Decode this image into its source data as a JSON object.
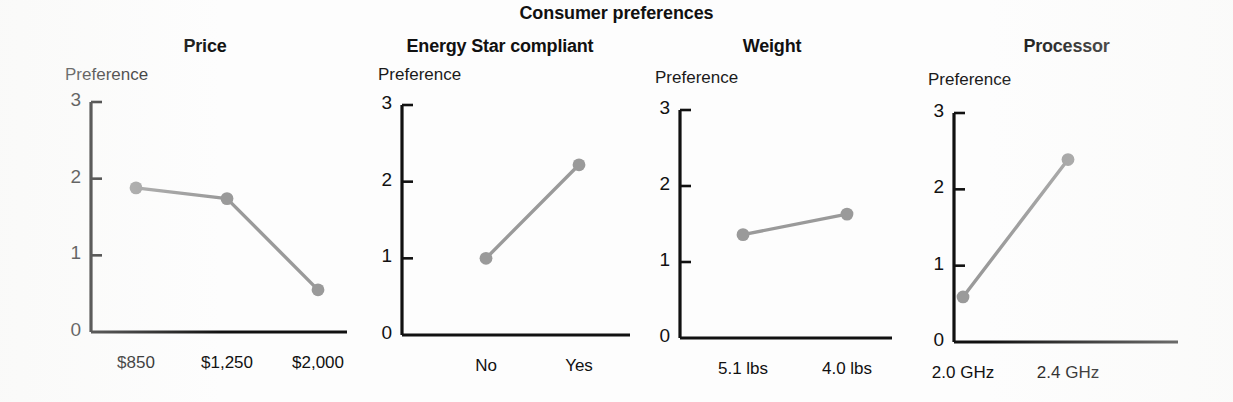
{
  "figure": {
    "title": "Consumer preferences",
    "y_axis_name": "Preference",
    "axis_color": "#111111",
    "series_color": "#9a9a9a",
    "background": "#ffffff"
  },
  "chart_data": {
    "type": "line",
    "title": "Consumer preferences",
    "ylabel": "Preference",
    "xlabel": "",
    "ylim": [
      0,
      3
    ],
    "yticks": [
      "0",
      "1",
      "2",
      "3"
    ],
    "grid": false,
    "legend": "none",
    "panels": [
      {
        "title": "Price",
        "ylabel": "Preference",
        "categories": [
          "$850",
          "$1,250",
          "$2,000"
        ],
        "values": [
          1.88,
          1.74,
          0.55
        ],
        "ylim": [
          0,
          3
        ],
        "yticks": [
          "0",
          "1",
          "2",
          "3"
        ]
      },
      {
        "title": "Energy Star compliant",
        "ylabel": "Preference",
        "categories": [
          "No",
          "Yes"
        ],
        "values": [
          1.0,
          2.22
        ],
        "ylim": [
          0,
          3
        ],
        "yticks": [
          "0",
          "1",
          "2",
          "3"
        ]
      },
      {
        "title": "Weight",
        "ylabel": "Preference",
        "categories": [
          "5.1 lbs",
          "4.0 lbs"
        ],
        "values": [
          1.36,
          1.63
        ],
        "ylim": [
          0,
          3
        ],
        "yticks": [
          "0",
          "1",
          "2",
          "3"
        ]
      },
      {
        "title": "Processor",
        "ylabel": "Preference",
        "categories": [
          "2.0 GHz",
          "2.4 GHz"
        ],
        "values": [
          0.59,
          2.39
        ],
        "ylim": [
          0,
          3
        ],
        "yticks": [
          "0",
          "1",
          "2",
          "3"
        ]
      }
    ]
  }
}
